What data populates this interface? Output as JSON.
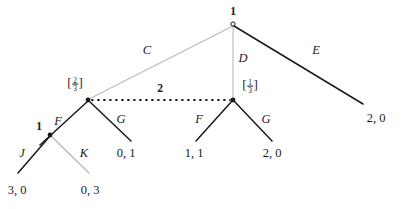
{
  "figure": {
    "type": "extensive-form-game-tree",
    "width": 404,
    "height": 209,
    "background": "#ffffff"
  },
  "colors": {
    "edge_dark": "#1a1a1a",
    "edge_light": "#b9b9b9",
    "node_fill": "#1a1a1a",
    "text": "#1a1a1a",
    "dotted_line": "#1a1a1a"
  },
  "nodes": [
    {
      "id": "root",
      "player_label": "1",
      "x": 233,
      "y": 24,
      "style": "open",
      "label_x": 233,
      "label_y": 12
    },
    {
      "id": "left-infoset",
      "belief": "2/3",
      "x": 88,
      "y": 100,
      "style": "filled",
      "label_x": 75,
      "label_y": 84
    },
    {
      "id": "right-infoset",
      "belief": "1/3",
      "x": 233,
      "y": 100,
      "style": "filled",
      "label_x": 250,
      "label_y": 86
    },
    {
      "id": "inner-1",
      "player_label": "1",
      "x": 50,
      "y": 135,
      "style": "filled",
      "label_x": 39,
      "label_y": 127
    }
  ],
  "beliefs": {
    "left": {
      "open_bracket": "[",
      "numerator": "2",
      "denominator": "3",
      "close_bracket": "]"
    },
    "right": {
      "open_bracket": "[",
      "numerator": "1",
      "denominator": "3",
      "close_bracket": "]"
    }
  },
  "edges": [
    {
      "id": "edge-C",
      "from": "root",
      "to": "left-infoset",
      "x1": 233,
      "y1": 26,
      "x2": 89,
      "y2": 99,
      "color": "light",
      "width": 1.1
    },
    {
      "id": "edge-D",
      "from": "root",
      "to": "right-infoset",
      "x1": 233,
      "y1": 26,
      "x2": 233,
      "y2": 99,
      "color": "light",
      "width": 1.1
    },
    {
      "id": "edge-E",
      "from": "root",
      "to": "payoff-E",
      "x1": 234,
      "y1": 26,
      "x2": 363,
      "y2": 104,
      "color": "dark",
      "width": 1.5
    },
    {
      "id": "edge-F-left",
      "from": "left-infoset",
      "to": "inner-1",
      "x1": 88,
      "y1": 101,
      "x2": 40,
      "y2": 145,
      "color": "dark",
      "width": 1.5
    },
    {
      "id": "edge-G-left",
      "from": "left-infoset",
      "to": "payoff-01",
      "x1": 89,
      "y1": 101,
      "x2": 131,
      "y2": 141,
      "color": "dark",
      "width": 1.5
    },
    {
      "id": "edge-J",
      "from": "inner-1",
      "to": "payoff-30",
      "x1": 50,
      "y1": 136,
      "x2": 18,
      "y2": 173,
      "color": "dark",
      "width": 1.5
    },
    {
      "id": "edge-K",
      "from": "inner-1",
      "to": "payoff-03",
      "x1": 51,
      "y1": 136,
      "x2": 89,
      "y2": 173,
      "color": "light",
      "width": 1.3
    },
    {
      "id": "edge-F-right",
      "from": "right-infoset",
      "to": "payoff-11",
      "x1": 232,
      "y1": 101,
      "x2": 196,
      "y2": 141,
      "color": "dark",
      "width": 1.5
    },
    {
      "id": "edge-G-right",
      "from": "right-infoset",
      "to": "payoff-20",
      "x1": 234,
      "y1": 101,
      "x2": 272,
      "y2": 141,
      "color": "dark",
      "width": 1.5
    }
  ],
  "infoset_link": {
    "id": "infoset-dotted-link",
    "x1": 92,
    "y1": 100,
    "x2": 230,
    "y2": 100,
    "label": "2",
    "label_x": 160,
    "label_y": 89,
    "style": "dotted"
  },
  "action_labels": [
    {
      "id": "label-C",
      "text": "C",
      "x": 147,
      "y": 50
    },
    {
      "id": "label-D",
      "text": "D",
      "x": 243,
      "y": 58
    },
    {
      "id": "label-E",
      "text": "E",
      "x": 316,
      "y": 50
    },
    {
      "id": "label-F-left",
      "text": "F",
      "x": 58,
      "y": 121
    },
    {
      "id": "label-G-left",
      "text": "G",
      "x": 121,
      "y": 119
    },
    {
      "id": "label-J",
      "text": "J",
      "x": 22,
      "y": 153
    },
    {
      "id": "label-K",
      "text": "K",
      "x": 84,
      "y": 153
    },
    {
      "id": "label-F-right",
      "text": "F",
      "x": 199,
      "y": 119
    },
    {
      "id": "label-G-right",
      "text": "G",
      "x": 266,
      "y": 119
    }
  ],
  "payoffs": [
    {
      "id": "payoff-E",
      "text": "2, 0",
      "x": 376,
      "y": 118
    },
    {
      "id": "payoff-01",
      "text": "0, 1",
      "x": 126,
      "y": 153
    },
    {
      "id": "payoff-11",
      "text": "1, 1",
      "x": 194,
      "y": 153
    },
    {
      "id": "payoff-20",
      "text": "2, 0",
      "x": 272,
      "y": 153
    },
    {
      "id": "payoff-30",
      "text": "3, 0",
      "x": 17,
      "y": 190
    },
    {
      "id": "payoff-03",
      "text": "0, 3",
      "x": 90,
      "y": 190
    }
  ]
}
